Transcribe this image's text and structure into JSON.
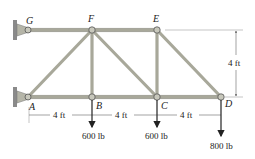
{
  "diagram": {
    "type": "truss",
    "joints": {
      "A": "A",
      "B": "B",
      "C": "C",
      "D": "D",
      "E": "E",
      "F": "F",
      "G": "G"
    },
    "dimensions": {
      "panel_1": "4 ft",
      "panel_2": "4 ft",
      "panel_3": "4 ft",
      "height": "4 ft"
    },
    "loads": {
      "B": "600 lb",
      "C": "600 lb",
      "D": "800 lb"
    },
    "members": [
      "GF",
      "FE",
      "AB",
      "BC",
      "CD",
      "AF",
      "FB",
      "FC",
      "EC",
      "ED"
    ],
    "supports": [
      "G",
      "A"
    ]
  }
}
